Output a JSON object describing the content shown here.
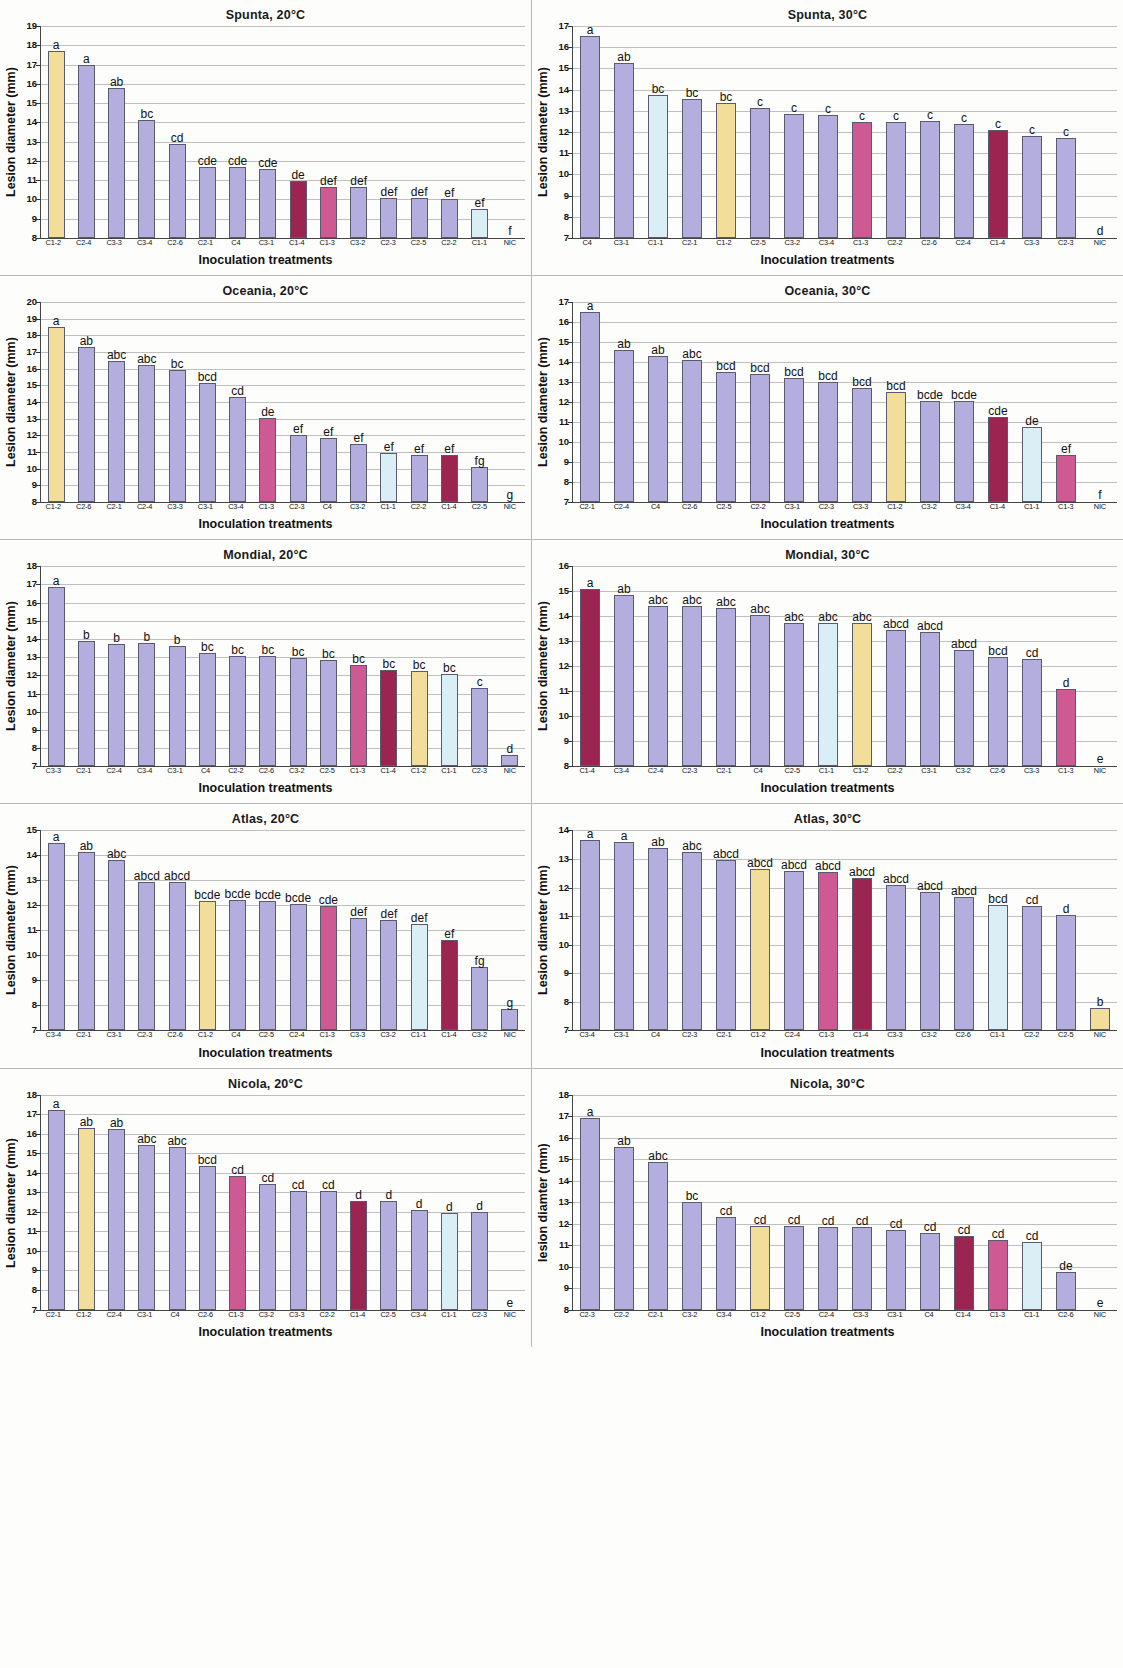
{
  "figure": {
    "axis_title_x": "Inoculation treatments",
    "axis_title_y": "Lesion diameter (mm)",
    "axis_title_y_alt": "lesion diamter (mm)",
    "colors": {
      "default_bar": "#b3aedd",
      "cream": "#f3dd9a",
      "pale_blue": "#d9eef5",
      "pink": "#cd5a92",
      "dark_red": "#9b2550",
      "bar_edge": "#5a5a6e",
      "grid": "#bfbfbf",
      "axis": "#444444"
    }
  },
  "chart_data": [
    {
      "id": "spunta-20",
      "type": "bar",
      "title": "Spunta, 20°C",
      "xlabel": "Inoculation treatments",
      "ylabel": "Lesion diameter (mm)",
      "ylim": [
        8,
        19
      ],
      "yticks": [
        8,
        9,
        10,
        11,
        12,
        13,
        14,
        15,
        16,
        17,
        18,
        19
      ],
      "grid": true,
      "categories": [
        "C1-2",
        "C2-4",
        "C3-3",
        "C3-4",
        "C2-6",
        "C2-1",
        "C4",
        "C3-1",
        "C1-4",
        "C1-3",
        "C3-2",
        "C2-3",
        "C2-5",
        "C2-2",
        "C1-1",
        "NIC"
      ],
      "values": [
        17.7,
        17.0,
        15.8,
        14.1,
        12.9,
        11.7,
        11.7,
        11.6,
        10.95,
        10.65,
        10.65,
        10.1,
        10.1,
        10.0,
        9.5,
        8.0
      ],
      "labels": [
        "a",
        "a",
        "ab",
        "bc",
        "cd",
        "cde",
        "cde",
        "cde",
        "de",
        "def",
        "def",
        "def",
        "def",
        "ef",
        "ef",
        "f"
      ],
      "bar_colors": [
        "cream",
        "default",
        "default",
        "default",
        "default",
        "default",
        "default",
        "default",
        "dark_red",
        "pink",
        "default",
        "default",
        "default",
        "default",
        "pale_blue",
        "default"
      ]
    },
    {
      "id": "spunta-30",
      "type": "bar",
      "title": "Spunta, 30°C",
      "xlabel": "Inoculation treatments",
      "ylabel": "Lesion diameter (mm)",
      "ylim": [
        7,
        17
      ],
      "yticks": [
        7,
        8,
        9,
        10,
        11,
        12,
        13,
        14,
        15,
        16,
        17
      ],
      "grid": true,
      "categories": [
        "C4",
        "C3-1",
        "C1-1",
        "C2-1",
        "C1-2",
        "C2-5",
        "C3-2",
        "C3-4",
        "C1-3",
        "C2-2",
        "C2-6",
        "C2-4",
        "C1-4",
        "C3-3",
        "C2-3",
        "NIC"
      ],
      "values": [
        16.55,
        15.25,
        13.75,
        13.55,
        13.35,
        13.15,
        12.85,
        12.78,
        12.47,
        12.47,
        12.5,
        12.38,
        12.08,
        11.8,
        11.7,
        7.0
      ],
      "labels": [
        "a",
        "ab",
        "bc",
        "bc",
        "bc",
        "c",
        "c",
        "c",
        "c",
        "c",
        "c",
        "c",
        "c",
        "c",
        "c",
        "d"
      ],
      "bar_colors": [
        "default",
        "default",
        "pale_blue",
        "default",
        "cream",
        "default",
        "default",
        "default",
        "pink",
        "default",
        "default",
        "default",
        "dark_red",
        "default",
        "default",
        "default"
      ]
    },
    {
      "id": "oceania-20",
      "type": "bar",
      "title": "Oceania, 20°C",
      "xlabel": "Inoculation treatments",
      "ylabel": "Lesion diameter (mm)",
      "ylim": [
        8,
        20
      ],
      "yticks": [
        8,
        9,
        10,
        11,
        12,
        13,
        14,
        15,
        16,
        17,
        18,
        19,
        20
      ],
      "grid": true,
      "categories": [
        "C1-2",
        "C2-6",
        "C2-1",
        "C2-4",
        "C3-3",
        "C3-1",
        "C3-4",
        "C1-3",
        "C2-3",
        "C4",
        "C3-2",
        "C1-1",
        "C2-2",
        "C1-4",
        "C2-5",
        "NIC"
      ],
      "values": [
        18.5,
        17.3,
        16.45,
        16.25,
        15.9,
        15.15,
        14.3,
        13.05,
        12.05,
        11.85,
        11.5,
        10.95,
        10.85,
        10.8,
        10.1,
        8.0
      ],
      "labels": [
        "a",
        "ab",
        "abc",
        "abc",
        "bc",
        "bcd",
        "cd",
        "de",
        "ef",
        "ef",
        "ef",
        "ef",
        "ef",
        "ef",
        "fg",
        "g"
      ],
      "bar_colors": [
        "cream",
        "default",
        "default",
        "default",
        "default",
        "default",
        "default",
        "pink",
        "default",
        "default",
        "default",
        "pale_blue",
        "default",
        "dark_red",
        "default",
        "default"
      ]
    },
    {
      "id": "oceania-30",
      "type": "bar",
      "title": "Oceania, 30°C",
      "xlabel": "Inoculation treatments",
      "ylabel": "Lesion diameter (mm)",
      "ylim": [
        7,
        17
      ],
      "yticks": [
        7,
        8,
        9,
        10,
        11,
        12,
        13,
        14,
        15,
        16,
        17
      ],
      "grid": true,
      "categories": [
        "C2-1",
        "C2-4",
        "C4",
        "C2-6",
        "C2-5",
        "C3-2",
        "C3-1",
        "C2-3",
        "C3-3",
        "C1-2",
        "C3-2b",
        "C3-4",
        "C1-4",
        "C1-1",
        "C1-3",
        "NIC"
      ],
      "categories_display": [
        "C2-1",
        "C2-4",
        "C4",
        "C2-6",
        "C2-5",
        "C2-2",
        "C3-1",
        "C2-3",
        "C3-3",
        "C1-2",
        "C3-2",
        "C3-4",
        "C1-4",
        "C1-1",
        "C1-3",
        "NIC"
      ],
      "values": [
        16.5,
        14.6,
        14.3,
        14.1,
        13.5,
        13.42,
        13.22,
        13.0,
        12.72,
        12.5,
        12.05,
        12.05,
        11.27,
        10.75,
        9.35,
        7.0
      ],
      "labels": [
        "a",
        "ab",
        "ab",
        "abc",
        "bcd",
        "bcd",
        "bcd",
        "bcd",
        "bcd",
        "bcd",
        "bcde",
        "bcde",
        "cde",
        "de",
        "ef",
        "f"
      ],
      "bar_colors": [
        "default",
        "default",
        "default",
        "default",
        "default",
        "default",
        "default",
        "default",
        "default",
        "cream",
        "default",
        "default",
        "dark_red",
        "pale_blue",
        "pink",
        "default"
      ]
    },
    {
      "id": "mondial-20",
      "type": "bar",
      "title": "Mondial, 20°C",
      "xlabel": "Inoculation treatments",
      "ylabel": "Lesion diameter (mm)",
      "ylim": [
        7,
        18
      ],
      "yticks": [
        7,
        8,
        9,
        10,
        11,
        12,
        13,
        14,
        15,
        16,
        17,
        18
      ],
      "grid": true,
      "categories": [
        "C3-3",
        "C2-1",
        "C2-4",
        "C3-4",
        "C3-1",
        "C4",
        "C2-2",
        "C2-6",
        "C3-2",
        "C2-5",
        "C1-3",
        "C1-4",
        "C1-2",
        "C1-1",
        "C2-3",
        "NIC"
      ],
      "values": [
        16.85,
        13.88,
        13.75,
        13.78,
        13.6,
        13.23,
        13.07,
        13.08,
        12.93,
        12.83,
        12.55,
        12.28,
        12.23,
        12.08,
        11.28,
        7.6
      ],
      "labels": [
        "a",
        "b",
        "b",
        "b",
        "b",
        "bc",
        "bc",
        "bc",
        "bc",
        "bc",
        "bc",
        "bc",
        "bc",
        "bc",
        "c",
        "d"
      ],
      "bar_colors": [
        "default",
        "default",
        "default",
        "default",
        "default",
        "default",
        "default",
        "default",
        "default",
        "default",
        "pink",
        "dark_red",
        "cream",
        "pale_blue",
        "default",
        "default"
      ]
    },
    {
      "id": "mondial-30",
      "type": "bar",
      "title": "Mondial, 30°C",
      "xlabel": "Inoculation treatments",
      "ylabel": "Lesion diameter (mm)",
      "ylim": [
        8,
        16
      ],
      "yticks": [
        8,
        9,
        10,
        11,
        12,
        13,
        14,
        15,
        16
      ],
      "grid": true,
      "categories": [
        "C1-4",
        "C3-4",
        "C2-4",
        "C2-3",
        "C2-1",
        "C4",
        "C2-5",
        "C1-1",
        "C1-2",
        "C2-2",
        "C3-1",
        "C3-2",
        "C2-6",
        "C3-3",
        "C1-3",
        "NIC"
      ],
      "values": [
        15.1,
        14.85,
        14.43,
        14.43,
        14.35,
        14.05,
        13.72,
        13.73,
        13.73,
        13.45,
        13.38,
        12.65,
        12.37,
        12.28,
        11.1,
        8.0
      ],
      "labels": [
        "a",
        "ab",
        "abc",
        "abc",
        "abc",
        "abc",
        "abc",
        "abc",
        "abc",
        "abcd",
        "abcd",
        "abcd",
        "bcd",
        "cd",
        "d",
        "e"
      ],
      "bar_colors": [
        "dark_red",
        "default",
        "default",
        "default",
        "default",
        "default",
        "default",
        "pale_blue",
        "cream",
        "default",
        "default",
        "default",
        "default",
        "default",
        "pink",
        "default"
      ]
    },
    {
      "id": "atlas-20",
      "type": "bar",
      "title": "Atlas, 20°C",
      "xlabel": "Inoculation treatments",
      "ylabel": "Lesion diameter (mm)",
      "ylim": [
        7,
        15
      ],
      "yticks": [
        7,
        8,
        9,
        10,
        11,
        12,
        13,
        14,
        15
      ],
      "grid": true,
      "categories": [
        "C3-4",
        "C2-1",
        "C3-1",
        "C2-3",
        "C2-6",
        "C1-2",
        "C4",
        "C2-5",
        "C2-4",
        "C1-3",
        "C3-3",
        "C3-2",
        "C1-1",
        "C1-4",
        "C3-2b",
        "NIC"
      ],
      "categories_display": [
        "C3-4",
        "C2-1",
        "C3-1",
        "C2-3",
        "C2-6",
        "C1-2",
        "C4",
        "C2-5",
        "C2-4",
        "C1-3",
        "C3-3",
        "C3-2",
        "C1-1",
        "C1-4",
        "C3-2",
        "NIC"
      ],
      "values": [
        14.5,
        14.12,
        13.82,
        12.93,
        12.92,
        12.18,
        12.2,
        12.17,
        12.05,
        11.98,
        11.48,
        11.4,
        11.27,
        10.6,
        9.55,
        7.85
      ],
      "labels": [
        "a",
        "ab",
        "abc",
        "abcd",
        "abcd",
        "bcde",
        "bcde",
        "bcde",
        "bcde",
        "cde",
        "def",
        "def",
        "def",
        "ef",
        "fg",
        "g"
      ],
      "bar_colors": [
        "default",
        "default",
        "default",
        "default",
        "default",
        "cream",
        "default",
        "default",
        "default",
        "pink",
        "default",
        "default",
        "pale_blue",
        "dark_red",
        "default",
        "default"
      ]
    },
    {
      "id": "atlas-30",
      "type": "bar",
      "title": "Atlas, 30°C",
      "xlabel": "Inoculation treatments",
      "ylabel": "Lesion diameter (mm)",
      "ylim": [
        7,
        14
      ],
      "yticks": [
        7,
        8,
        9,
        10,
        11,
        12,
        13,
        14
      ],
      "grid": true,
      "categories": [
        "C3-4",
        "C3-1",
        "C4",
        "C2-3",
        "C2-1",
        "C1-2",
        "C2-4",
        "C1-3",
        "C1-4",
        "C3-3",
        "C3-2",
        "C2-6",
        "C1-1",
        "C2-2",
        "C2-5",
        "NIC"
      ],
      "values": [
        13.65,
        13.6,
        13.4,
        13.25,
        12.95,
        12.65,
        12.57,
        12.53,
        12.35,
        12.08,
        11.85,
        11.68,
        11.4,
        11.35,
        11.05,
        7.8
      ],
      "labels": [
        "a",
        "a",
        "ab",
        "abc",
        "abcd",
        "abcd",
        "abcd",
        "abcd",
        "abcd",
        "abcd",
        "abcd",
        "abcd",
        "bcd",
        "cd",
        "d",
        "b"
      ],
      "bar_colors": [
        "default",
        "default",
        "default",
        "default",
        "default",
        "cream",
        "default",
        "pink",
        "dark_red",
        "default",
        "default",
        "default",
        "pale_blue",
        "default",
        "default",
        "cream"
      ]
    },
    {
      "id": "nicola-20",
      "type": "bar",
      "title": "Nicola, 20°C",
      "xlabel": "Inoculation treatments",
      "ylabel": "Lesion diameter (mm)",
      "ylim": [
        7,
        18
      ],
      "yticks": [
        7,
        8,
        9,
        10,
        11,
        12,
        13,
        14,
        15,
        16,
        17,
        18
      ],
      "grid": true,
      "categories": [
        "C2-1",
        "C1-2",
        "C2-4",
        "C3-1",
        "C4",
        "C2-6",
        "C1-3",
        "C3-2",
        "C3-3",
        "C2-2",
        "C1-4",
        "C2-5",
        "C3-4",
        "C1-1",
        "C2-3",
        "NIC"
      ],
      "values": [
        17.2,
        16.3,
        16.25,
        15.4,
        15.3,
        14.35,
        13.85,
        13.45,
        13.05,
        13.05,
        12.53,
        12.55,
        12.08,
        11.95,
        11.98,
        7.0
      ],
      "labels": [
        "a",
        "ab",
        "ab",
        "abc",
        "abc",
        "bcd",
        "cd",
        "cd",
        "cd",
        "cd",
        "d",
        "d",
        "d",
        "d",
        "d",
        "e"
      ],
      "bar_colors": [
        "default",
        "cream",
        "default",
        "default",
        "default",
        "default",
        "pink",
        "default",
        "default",
        "default",
        "dark_red",
        "default",
        "default",
        "pale_blue",
        "default",
        "default"
      ]
    },
    {
      "id": "nicola-30",
      "type": "bar",
      "title": "Nicola, 30°C",
      "xlabel": "Inoculation treatments",
      "ylabel": "lesion diamter (mm)",
      "ylim": [
        8,
        18
      ],
      "yticks": [
        8,
        9,
        10,
        11,
        12,
        13,
        14,
        15,
        16,
        17,
        18
      ],
      "grid": true,
      "categories": [
        "C2-3",
        "C2-2",
        "C2-1",
        "C3-2",
        "C3-4",
        "C1-2",
        "C2-5",
        "C2-4",
        "C3-3",
        "C3-1",
        "C4",
        "C1-4",
        "C1-3",
        "C1-1",
        "C2-6",
        "NIC"
      ],
      "values": [
        16.9,
        15.55,
        14.85,
        13.0,
        12.3,
        11.9,
        11.9,
        11.85,
        11.85,
        11.7,
        11.55,
        11.43,
        11.25,
        11.15,
        9.75,
        8.0
      ],
      "labels": [
        "a",
        "ab",
        "abc",
        "bc",
        "cd",
        "cd",
        "cd",
        "cd",
        "cd",
        "cd",
        "cd",
        "cd",
        "cd",
        "cd",
        "de",
        "e"
      ],
      "bar_colors": [
        "default",
        "default",
        "default",
        "default",
        "default",
        "cream",
        "default",
        "default",
        "default",
        "default",
        "default",
        "dark_red",
        "pink",
        "pale_blue",
        "default",
        "default"
      ]
    }
  ]
}
